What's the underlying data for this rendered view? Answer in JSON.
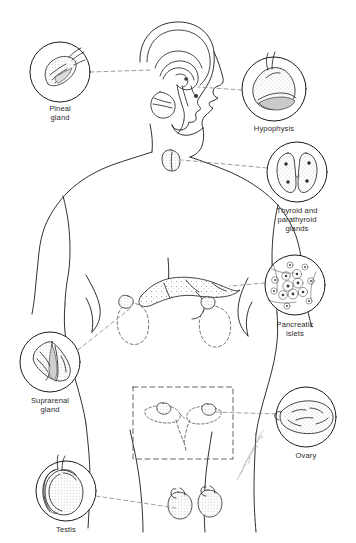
{
  "figure": {
    "background_color": "#ffffff",
    "ink_color": "#1a1a1a",
    "leader_line_color": "#8c8c8c",
    "label_color": "#2b2b2b",
    "width": 356,
    "height": 543
  },
  "callouts": [
    {
      "id": "pineal-gland",
      "label": "Pineal\ngland",
      "icon": "pineal-gland-icon",
      "circle": {
        "cx": 60,
        "cy": 72,
        "r": 30
      },
      "label_x": 60,
      "label_y": 108,
      "leader": {
        "x1": 90,
        "y1": 72,
        "x2": 152,
        "y2": 68
      }
    },
    {
      "id": "hypophysis",
      "label": "Hypophysis",
      "icon": "hypophysis-icon",
      "circle": {
        "cx": 274,
        "cy": 89,
        "r": 32
      },
      "label_x": 274,
      "label_y": 125,
      "leader": {
        "x1": 242,
        "y1": 89,
        "x2": 196,
        "y2": 83
      }
    },
    {
      "id": "thyroid-and-parathyroid-glands",
      "label": "Thyroid and\nparathyroid\nglands",
      "icon": "thyroid-gland-icon",
      "circle": {
        "cx": 297,
        "cy": 172,
        "r": 30
      },
      "label_x": 297,
      "label_y": 207,
      "leader": {
        "x1": 267,
        "y1": 168,
        "x2": 182,
        "y2": 159
      }
    },
    {
      "id": "pancreatic-islets",
      "label": "Pancreatic\nislets",
      "icon": "pancreatic-islets-icon",
      "circle": {
        "cx": 295,
        "cy": 285,
        "r": 30
      },
      "label_x": 295,
      "label_y": 321,
      "leader": {
        "x1": 265,
        "y1": 282,
        "x2": 228,
        "y2": 283
      }
    },
    {
      "id": "suprarenal-gland",
      "label": "Suprarenal\ngland",
      "icon": "suprarenal-gland-icon",
      "circle": {
        "cx": 50,
        "cy": 362,
        "r": 30
      },
      "label_x": 50,
      "label_y": 397,
      "leader": {
        "x1": 80,
        "y1": 352,
        "x2": 133,
        "y2": 313
      }
    },
    {
      "id": "ovary",
      "label": "Ovary",
      "icon": "ovary-icon",
      "circle": {
        "cx": 306,
        "cy": 417,
        "r": 30
      },
      "label_x": 306,
      "label_y": 452,
      "leader": {
        "x1": 276,
        "y1": 414,
        "x2": 232,
        "y2": 412
      }
    },
    {
      "id": "testis",
      "label": "Testis",
      "icon": "testis-icon",
      "circle": {
        "cx": 66,
        "cy": 491,
        "r": 30
      },
      "label_x": 66,
      "label_y": 526,
      "leader": {
        "x1": 96,
        "y1": 494,
        "x2": 178,
        "y2": 508
      }
    }
  ],
  "body_diagram": {
    "name": "human-torso-outline",
    "head": "sagittal-head-with-brain",
    "neck_organ": "thyroid-in-situ",
    "abdominal_organs": "pancreas-and-kidneys-in-situ",
    "pelvic_box": "uterus-and-ovaries-dashed-box",
    "lower_organs": "testes-in-situ"
  },
  "signature": {
    "name": "artist-signature",
    "visible": true
  }
}
